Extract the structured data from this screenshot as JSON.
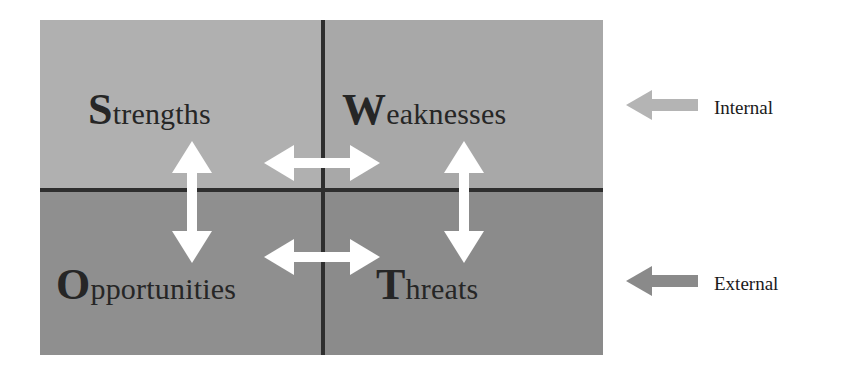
{
  "diagram": {
    "type": "swot-matrix",
    "quadrants": [
      {
        "key": "strengths",
        "dropcap": "S",
        "rest": "trengths",
        "full_label": "Strengths",
        "position": "top-left",
        "fill": "#b0b0b0"
      },
      {
        "key": "weaknesses",
        "dropcap": "W",
        "rest": "eaknesses",
        "full_label": "Weaknesses",
        "position": "top-right",
        "fill": "#a8a8a8"
      },
      {
        "key": "opportunities",
        "dropcap": "O",
        "rest": "pportunities",
        "full_label": "Opportunities",
        "position": "bottom-left",
        "fill": "#8f8f8f"
      },
      {
        "key": "threats",
        "dropcap": "T",
        "rest": "hreats",
        "full_label": "Threats",
        "position": "bottom-right",
        "fill": "#8b8b8b"
      }
    ],
    "divider_color": "#2e2e2e",
    "inner_arrow_color": "#ffffff",
    "inner_arrows": [
      {
        "key": "strengths-opportunities",
        "orientation": "vertical",
        "heads": "double"
      },
      {
        "key": "weaknesses-threats",
        "orientation": "vertical",
        "heads": "double"
      },
      {
        "key": "strengths-weaknesses",
        "orientation": "horizontal",
        "heads": "double"
      },
      {
        "key": "opportunities-threats",
        "orientation": "horizontal",
        "heads": "double"
      }
    ],
    "axes": [
      {
        "key": "internal",
        "label": "Internal",
        "arrow_direction": "left",
        "arrow_color": "#b4b4b4"
      },
      {
        "key": "external",
        "label": "External",
        "arrow_direction": "left",
        "arrow_color": "#8a8a8a"
      }
    ]
  }
}
